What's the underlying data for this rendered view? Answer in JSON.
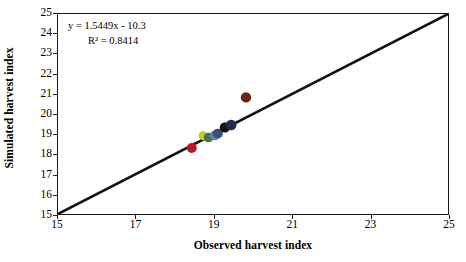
{
  "chart_data": {
    "type": "scatter",
    "title": "",
    "xlabel": "Observed harvest index",
    "ylabel": "Simulated harvest index",
    "xlim": [
      15,
      25
    ],
    "ylim": [
      15,
      25
    ],
    "xticks": [
      15,
      17,
      19,
      21,
      23,
      25
    ],
    "yticks": [
      15,
      16,
      17,
      18,
      19,
      20,
      21,
      22,
      23,
      24,
      25
    ],
    "grid": false,
    "legend": false,
    "annotations": {
      "equation": "y = 1.5449x - 10.3",
      "r_squared": "R² = 0.8414"
    },
    "reference_line": {
      "name": "one-to-one-line",
      "from": [
        15,
        15
      ],
      "to": [
        25,
        25
      ],
      "color": "#111111",
      "width": 2.6
    },
    "points": [
      {
        "name": "point-red",
        "x": 18.43,
        "y": 18.3,
        "color": "#b51a2b",
        "r": 5.0
      },
      {
        "name": "point-yellow",
        "x": 18.72,
        "y": 18.92,
        "color": "#c9c936",
        "r": 4.6
      },
      {
        "name": "point-green",
        "x": 18.86,
        "y": 18.82,
        "color": "#3f7a3a",
        "r": 4.8
      },
      {
        "name": "point-steel-blue",
        "x": 19.02,
        "y": 18.93,
        "color": "#5b7fa6",
        "r": 5.0
      },
      {
        "name": "point-slate-blue",
        "x": 19.1,
        "y": 19.02,
        "color": "#3c4f74",
        "r": 5.0
      },
      {
        "name": "point-black",
        "x": 19.28,
        "y": 19.33,
        "color": "#141414",
        "r": 5.2
      },
      {
        "name": "point-navy",
        "x": 19.44,
        "y": 19.45,
        "color": "#232a4d",
        "r": 5.4
      },
      {
        "name": "point-maroon",
        "x": 19.82,
        "y": 20.83,
        "color": "#6e2118",
        "r": 5.2
      }
    ]
  }
}
